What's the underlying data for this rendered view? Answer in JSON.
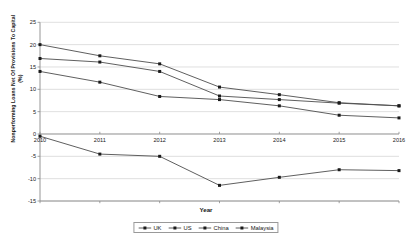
{
  "chart_data": {
    "type": "line",
    "title": "",
    "xlabel": "Year",
    "ylabel": "Nonperforming Loans Net Of Provisions To Capital (%)",
    "ylabel_line1": "Nonperforming Loans Net Of Provisions To Capital",
    "ylabel_line2": "(%)",
    "categories": [
      "2010",
      "2011",
      "2012",
      "2013",
      "2014",
      "2015",
      "2016"
    ],
    "x": [
      2010,
      2011,
      2012,
      2013,
      2014,
      2015,
      2016
    ],
    "xlim": [
      2010,
      2016
    ],
    "ylim": [
      -15,
      25
    ],
    "yticks": [
      25,
      20,
      15,
      10,
      5,
      0,
      -5,
      -10,
      -15
    ],
    "grid": true,
    "grid_axis": "y",
    "legend_position": "bottom",
    "series": [
      {
        "name": "UK",
        "values": [
          20.0,
          17.5,
          15.7,
          10.5,
          8.8,
          7.0,
          6.3
        ],
        "color": "#4d4d4d",
        "marker": "square"
      },
      {
        "name": "US",
        "values": [
          16.9,
          16.1,
          14.0,
          8.5,
          7.7,
          6.9,
          6.3
        ],
        "color": "#4d4d4d",
        "marker": "square"
      },
      {
        "name": "China",
        "values": [
          14.0,
          11.6,
          8.4,
          7.7,
          6.3,
          4.2,
          3.6
        ],
        "color": "#4d4d4d",
        "marker": "square"
      },
      {
        "name": "Malaysia",
        "values": [
          -0.5,
          -4.5,
          -5.0,
          -11.5,
          -9.7,
          -8.0,
          -8.2
        ],
        "color": "#4d4d4d",
        "marker": "square"
      }
    ]
  },
  "legend": {
    "entries": [
      {
        "label": "UK"
      },
      {
        "label": "US"
      },
      {
        "label": "China"
      },
      {
        "label": "Malaysia"
      }
    ]
  },
  "axis": {
    "y_ticks": [
      "25",
      "20",
      "15",
      "10",
      "5",
      "0",
      "-5",
      "-10",
      "-15"
    ],
    "x_ticks": [
      "2010",
      "2011",
      "2012",
      "2013",
      "2014",
      "2015",
      "2016"
    ],
    "x_title": "Year",
    "y_title_main": "Nonperforming Loans Net Of Provisions To Capital",
    "y_title_unit": "(%)"
  }
}
